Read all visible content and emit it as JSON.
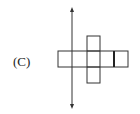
{
  "option_label": "(C)",
  "figure": {
    "stroke_color": "#333333"
  }
}
